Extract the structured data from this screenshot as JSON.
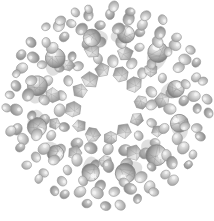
{
  "figure": {
    "description": "Grayscale rendering of a spherical colloidal cluster with a hollow core, an inner shell of faceted polyhedral crystals and concentric outer shells of small ellipsoidal particles interspersed with larger faceted spheres.",
    "background_color": "#ffffff",
    "canvas": {
      "width": 214,
      "height": 221
    },
    "center": {
      "x": 107,
      "y": 105
    },
    "core_radius": 19,
    "outer_radius": 101
  },
  "palette": {
    "light_gray": "#e3e3e3",
    "mid_gray": "#b4b4b4",
    "dark_gray": "#8a8a8a",
    "deep_gray": "#6e6e6e",
    "outline_gray": "#9a9a9a",
    "highlight": "#f2f2f2",
    "white": "#ffffff"
  },
  "chart_data": {
    "type": "scatter",
    "xlabel": "",
    "ylabel": "",
    "grid": false,
    "legend": null,
    "xlim": [
      0,
      214
    ],
    "ylim": [
      0,
      221
    ],
    "center": [
      107,
      105
    ],
    "shells": [
      {
        "name": "hollow-core",
        "radius": 0,
        "count": 0,
        "particle": "void",
        "size": 0
      },
      {
        "name": "inner-polyhedra",
        "radius": 33,
        "count": 12,
        "particle": "polyhedron",
        "size": 15
      },
      {
        "name": "ring-2-ellipsoids",
        "radius": 47,
        "count": 17,
        "particle": "ellipsoid",
        "size": 9
      },
      {
        "name": "ring-3-polyhedra",
        "radius": 55,
        "count": 11,
        "particle": "polyhedron",
        "size": 14
      },
      {
        "name": "ring-4-ellipsoids",
        "radius": 63,
        "count": 22,
        "particle": "ellipsoid",
        "size": 9
      },
      {
        "name": "ring-5-spheres",
        "radius": 72,
        "count": 12,
        "particle": "sphere",
        "size": 19
      },
      {
        "name": "ring-6-ellipsoids",
        "radius": 79,
        "count": 27,
        "particle": "ellipsoid",
        "size": 9
      },
      {
        "name": "ring-7-ellipsoids",
        "radius": 90,
        "count": 31,
        "particle": "ellipsoid",
        "size": 9
      },
      {
        "name": "ring-8-ellipsoids",
        "radius": 99,
        "count": 34,
        "particle": "ellipsoid",
        "size": 8
      }
    ],
    "particle_types": [
      {
        "id": "ellipsoid",
        "label": "small ellipsoidal particle",
        "fill": "#cfcfcf",
        "count_total": 131
      },
      {
        "id": "polyhedron",
        "label": "faceted polyhedral crystal",
        "fill": "#b8b8b8",
        "count_total": 23
      },
      {
        "id": "sphere",
        "label": "large faceted sphere",
        "fill": "#a8a8a8",
        "count_total": 12
      }
    ],
    "total_particles": 166
  }
}
